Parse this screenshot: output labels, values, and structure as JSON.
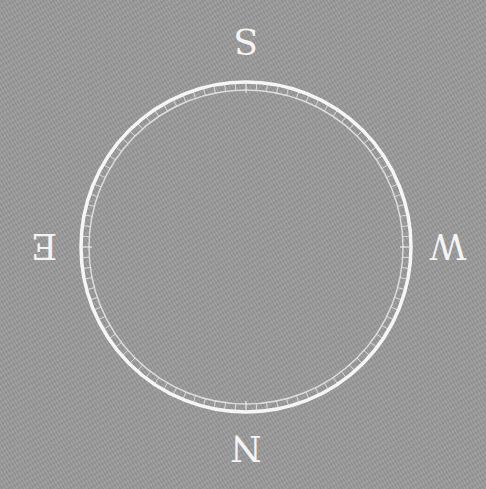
{
  "compass": {
    "rotation_deg": 180,
    "center": [
      246,
      247
    ],
    "outer_radius": 166,
    "inner_radius": 157,
    "tick_count": 96,
    "colors": {
      "background": "#9a9a9a",
      "ring": "#f6f6f6",
      "letters": "#f4f4f4"
    },
    "directions": {
      "north": "N",
      "east": "E",
      "south": "S",
      "west": "W"
    }
  }
}
